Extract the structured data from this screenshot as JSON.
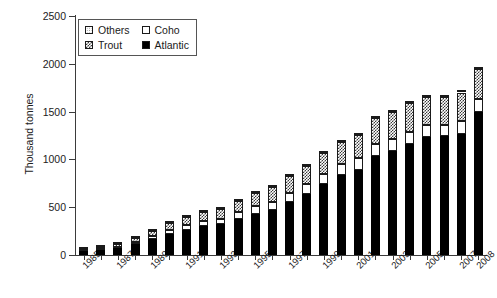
{
  "chart_data": {
    "type": "bar",
    "subtype": "stacked-vertical",
    "title": "",
    "xlabel": "",
    "ylabel": "Thousand tonnes",
    "ylim": [
      0,
      2500
    ],
    "yticks": [
      0,
      500,
      1000,
      1500,
      2000,
      2500
    ],
    "grid": false,
    "legend_position": "top-left",
    "categories": [
      "1985",
      "1986",
      "1987",
      "1988",
      "1989",
      "1990",
      "1991",
      "1992",
      "1993",
      "1994",
      "1995",
      "1996",
      "1997",
      "1998",
      "1999",
      "2000",
      "2001",
      "2002",
      "2003",
      "2004",
      "2005",
      "2006",
      "2007",
      "2008"
    ],
    "tick_labels_shown": [
      "1985",
      "1987",
      "1989",
      "1991",
      "1993",
      "1995",
      "1997",
      "1999",
      "2001",
      "2003",
      "2005",
      "2007",
      "2008"
    ],
    "series": [
      {
        "name": "Atlantic",
        "color": "#000000",
        "pattern": "solid-black",
        "values": [
          45,
          55,
          75,
          115,
          170,
          225,
          265,
          300,
          320,
          380,
          430,
          470,
          555,
          640,
          740,
          840,
          890,
          1040,
          1090,
          1160,
          1230,
          1240,
          1270,
          1500
        ]
      },
      {
        "name": "Coho",
        "color": "#ffffff",
        "pattern": "white",
        "values": [
          5,
          8,
          12,
          18,
          25,
          35,
          45,
          55,
          60,
          70,
          80,
          85,
          95,
          100,
          110,
          115,
          120,
          120,
          120,
          125,
          125,
          125,
          130,
          130
        ]
      },
      {
        "name": "Trout",
        "color": "#ffffff",
        "pattern": "checkered",
        "values": [
          18,
          22,
          30,
          45,
          60,
          70,
          85,
          95,
          105,
          120,
          140,
          155,
          175,
          190,
          215,
          230,
          250,
          270,
          285,
          300,
          300,
          290,
          300,
          320
        ]
      },
      {
        "name": "Others",
        "color": "#ffffff",
        "pattern": "dotted",
        "values": [
          2,
          3,
          3,
          5,
          5,
          5,
          5,
          5,
          5,
          5,
          5,
          5,
          5,
          5,
          5,
          5,
          5,
          5,
          5,
          5,
          5,
          5,
          5,
          5
        ]
      }
    ],
    "totals": [
      70,
      88,
      120,
      183,
      260,
      335,
      400,
      455,
      490,
      575,
      655,
      715,
      830,
      935,
      1070,
      1190,
      1265,
      1435,
      1500,
      1590,
      1660,
      1660,
      1705,
      1955
    ]
  },
  "legend": {
    "entries": [
      {
        "label": "Others",
        "swatch": "others-swatch"
      },
      {
        "label": "Coho",
        "swatch": "coho-swatch"
      },
      {
        "label": "Trout",
        "swatch": "trout-swatch"
      },
      {
        "label": "Atlantic",
        "swatch": "atlantic-swatch"
      }
    ]
  },
  "colors": {
    "axis": "#3b3b3b",
    "text": "#222222",
    "atlantic": "#000000",
    "coho": "#ffffff",
    "trout_hatch": "#3a3a3a",
    "others_dot": "#8a8a8a"
  }
}
